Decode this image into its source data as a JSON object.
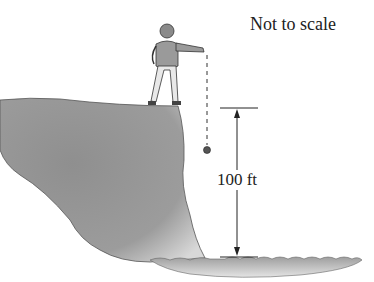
{
  "diagram": {
    "note": "Not to scale",
    "dimension_label": "100 ft",
    "elements": [
      "cliff",
      "person",
      "dropped-ball",
      "dashed-path",
      "height-dimension-arrow",
      "water-surface"
    ]
  },
  "colors": {
    "cliff": "#9a9a9a",
    "water": "#a6a6a6",
    "ink": "#222222",
    "background": "#ffffff"
  }
}
